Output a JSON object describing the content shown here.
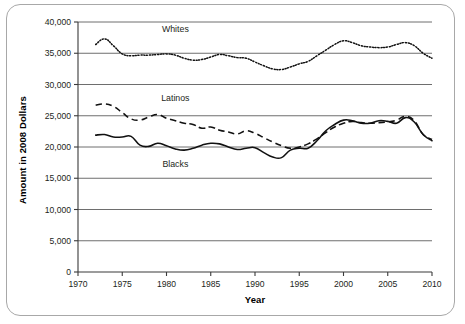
{
  "chart_data": {
    "type": "line",
    "title": "",
    "xlabel": "Year",
    "ylabel": "Amount in 2008 Dollars",
    "xlim": [
      1970,
      2010
    ],
    "ylim": [
      0,
      40000
    ],
    "xticks": [
      1970,
      1975,
      1980,
      1985,
      1990,
      1995,
      2000,
      2005,
      2010
    ],
    "xtick_labels": [
      "1970",
      "1975",
      "1980",
      "1985",
      "1990",
      "1995",
      "2000",
      "2005",
      "2010"
    ],
    "yticks": [
      0,
      5000,
      10000,
      15000,
      20000,
      25000,
      30000,
      35000,
      40000
    ],
    "ytick_labels": [
      "0",
      "5,000",
      "10,000",
      "15,000",
      "20,000",
      "25,000",
      "30,000",
      "35,000",
      "40,000"
    ],
    "grid": "horizontal",
    "legend_position": "inline-annotations",
    "x": [
      1972,
      1973,
      1974,
      1975,
      1976,
      1977,
      1978,
      1979,
      1980,
      1981,
      1982,
      1983,
      1984,
      1985,
      1986,
      1987,
      1988,
      1989,
      1990,
      1991,
      1992,
      1993,
      1994,
      1995,
      1996,
      1997,
      1998,
      1999,
      2000,
      2001,
      2002,
      2003,
      2004,
      2005,
      2006,
      2007,
      2008,
      2009,
      2010
    ],
    "series": [
      {
        "name": "Whites",
        "style": "dotted",
        "label_x": 1981,
        "label_y": 38400,
        "values": [
          36400,
          37300,
          36200,
          34900,
          34600,
          34700,
          34700,
          34800,
          34900,
          34700,
          34200,
          33900,
          34000,
          34400,
          34800,
          34600,
          34300,
          34200,
          33600,
          33000,
          32500,
          32400,
          32800,
          33300,
          33700,
          34600,
          35500,
          36400,
          37000,
          36700,
          36200,
          36000,
          35900,
          36000,
          36400,
          36700,
          36200,
          35000,
          34200
        ]
      },
      {
        "name": "Latinos",
        "style": "dashed",
        "label_x": 1981,
        "label_y": 27300,
        "values": [
          26700,
          26900,
          26500,
          25500,
          24500,
          24300,
          24800,
          25200,
          24600,
          24200,
          23800,
          23600,
          23000,
          23200,
          22700,
          22400,
          22100,
          22600,
          22200,
          21500,
          20800,
          20200,
          19800,
          20000,
          20500,
          21300,
          22300,
          23200,
          23800,
          24100,
          23900,
          23800,
          23900,
          24000,
          24300,
          24900,
          24200,
          22000,
          21200
        ]
      },
      {
        "name": "Blacks",
        "style": "solid",
        "label_x": 1981,
        "label_y": 16800,
        "values": [
          21900,
          22000,
          21600,
          21600,
          21700,
          20300,
          20100,
          20600,
          20200,
          19700,
          19500,
          19800,
          20300,
          20600,
          20500,
          20000,
          19600,
          19800,
          19900,
          19100,
          18400,
          18300,
          19500,
          19800,
          19800,
          21000,
          22600,
          23600,
          24300,
          24200,
          23800,
          23800,
          24200,
          24100,
          23800,
          24700,
          24000,
          22000,
          21000
        ]
      }
    ]
  }
}
